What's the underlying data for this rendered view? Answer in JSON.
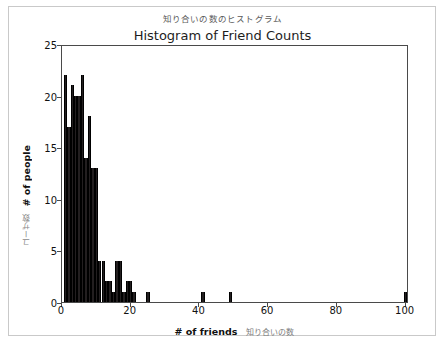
{
  "figure": {
    "jp_title": "知り合いの数のヒストグラム",
    "main_title": "Histogram of Friend Counts",
    "xlabel_en": "# of friends",
    "xlabel_jp": "知り合いの数",
    "ylabel_en": "# of people",
    "ylabel_jp": "ユーザ数",
    "footer_note": ""
  },
  "colors": {
    "bar": "#231f20",
    "axis": "#4a4a4a",
    "frame": "#c9c9c9",
    "jp_text": "#7c7c7c",
    "en_text": "#111111"
  },
  "chart_data": {
    "type": "bar",
    "title": "Histogram of Friend Counts",
    "subtitle": "知り合いの数のヒストグラム",
    "xlabel": "# of friends",
    "ylabel": "# of people",
    "xlim": [
      0,
      101
    ],
    "ylim": [
      0,
      25
    ],
    "grid": false,
    "legend": null,
    "xticks": [
      0,
      20,
      40,
      60,
      80,
      100
    ],
    "yticks": [
      0,
      5,
      10,
      15,
      20,
      25
    ],
    "bin_width": 1,
    "x": [
      1,
      2,
      3,
      4,
      5,
      6,
      7,
      8,
      9,
      10,
      11,
      12,
      13,
      14,
      15,
      16,
      17,
      18,
      19,
      20,
      21,
      22,
      23,
      25,
      41,
      49,
      100
    ],
    "values": [
      22,
      17,
      21,
      20,
      20,
      22,
      14,
      18,
      13,
      13,
      4,
      4,
      2,
      2,
      1,
      4,
      4,
      1,
      2,
      2,
      1,
      0,
      0,
      1,
      1,
      1,
      1
    ],
    "bars": [
      {
        "x": 1,
        "y": 22
      },
      {
        "x": 2,
        "y": 17
      },
      {
        "x": 3,
        "y": 21
      },
      {
        "x": 4,
        "y": 20
      },
      {
        "x": 5,
        "y": 20
      },
      {
        "x": 6,
        "y": 22
      },
      {
        "x": 7,
        "y": 14
      },
      {
        "x": 8,
        "y": 18
      },
      {
        "x": 9,
        "y": 13
      },
      {
        "x": 10,
        "y": 13
      },
      {
        "x": 11,
        "y": 4
      },
      {
        "x": 12,
        "y": 4
      },
      {
        "x": 13,
        "y": 2
      },
      {
        "x": 14,
        "y": 2
      },
      {
        "x": 15,
        "y": 1
      },
      {
        "x": 16,
        "y": 4
      },
      {
        "x": 17,
        "y": 4
      },
      {
        "x": 18,
        "y": 1
      },
      {
        "x": 19,
        "y": 2
      },
      {
        "x": 20,
        "y": 2
      },
      {
        "x": 21,
        "y": 1
      },
      {
        "x": 25,
        "y": 1
      },
      {
        "x": 41,
        "y": 1
      },
      {
        "x": 49,
        "y": 1
      },
      {
        "x": 100,
        "y": 1
      }
    ]
  }
}
